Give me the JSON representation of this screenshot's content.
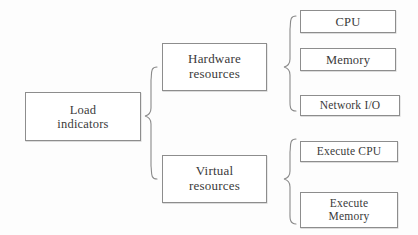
{
  "diagram": {
    "type": "hierarchy-tree",
    "orientation": "left-to-right",
    "connector_style": "curly-brace",
    "background_color": "#ffffff",
    "box_border_color": "#8d8d8d",
    "text_color": "#3a3a3a",
    "root": {
      "id": "load-indicators",
      "line1": "Load",
      "line2": "indicators"
    },
    "branches": [
      {
        "id": "hardware-resources",
        "line1": "Hardware",
        "line2": "resources",
        "leaves": [
          {
            "id": "cpu",
            "line1": "CPU",
            "line2": ""
          },
          {
            "id": "memory",
            "line1": "Memory",
            "line2": ""
          },
          {
            "id": "network-io",
            "line1": "Network I/O",
            "line2": ""
          }
        ]
      },
      {
        "id": "virtual-resources",
        "line1": "Virtual",
        "line2": "resources",
        "leaves": [
          {
            "id": "execute-cpu",
            "line1": "Execute CPU",
            "line2": ""
          },
          {
            "id": "execute-memory",
            "line1": "Execute",
            "line2": "Memory"
          }
        ]
      }
    ]
  }
}
